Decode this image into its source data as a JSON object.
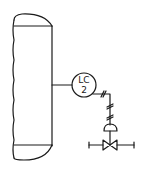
{
  "diagram": {
    "type": "P&ID",
    "vessel": {
      "label": "vessel"
    },
    "instrument": {
      "function_letters": "LC",
      "loop_number": "2",
      "description": "level controller"
    },
    "signal_line": {
      "type": "pneumatic"
    },
    "control_valve": {
      "actuator": "diaphragm"
    },
    "colors": {
      "ink": "#1a1a1a",
      "background": "#ffffff"
    }
  }
}
